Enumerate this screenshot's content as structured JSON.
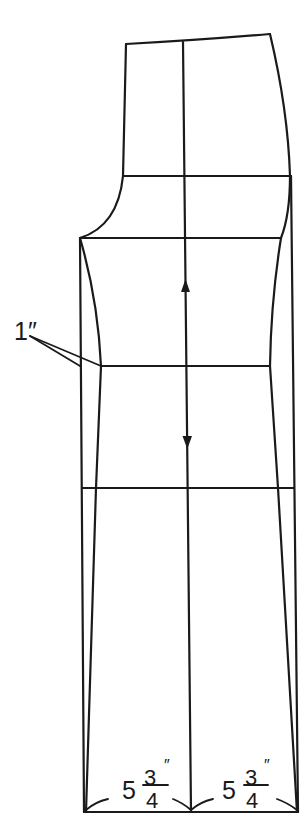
{
  "diagram": {
    "line_color": "#1a1a1a",
    "background": "#ffffff",
    "labels": {
      "side_offset": "1″",
      "hem_left_whole": "5",
      "hem_left_num": "3",
      "hem_left_den": "4",
      "hem_left_unit": "″",
      "hem_right_whole": "5",
      "hem_right_num": "3",
      "hem_right_den": "4",
      "hem_right_unit": "″"
    },
    "lines": [
      "waist",
      "hip",
      "crotch",
      "knee",
      "thigh",
      "hem",
      "grainline"
    ],
    "grainline_arrows": [
      "arrow-up",
      "arrow-down"
    ]
  }
}
